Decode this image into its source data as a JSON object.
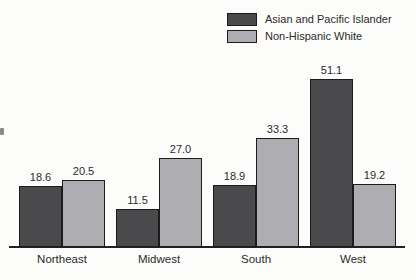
{
  "chart_data": {
    "type": "bar",
    "title": "",
    "xlabel": "",
    "ylabel": "",
    "categories": [
      "Northeast",
      "Midwest",
      "South",
      "West"
    ],
    "series": [
      {
        "name": "Asian and Pacific Islander",
        "color": "#4a4a4c",
        "values": [
          18.6,
          11.5,
          18.9,
          51.1
        ]
      },
      {
        "name": "Non-Hispanic White",
        "color": "#aeaeb2",
        "values": [
          20.5,
          27.0,
          33.3,
          19.2
        ]
      }
    ],
    "value_label_format": "one-decimal",
    "ylim": [
      0,
      55
    ],
    "grid": false,
    "legend_position": "top-right",
    "bar_outline_color": "#1c1c1c",
    "axis_color": "#222222",
    "background_color": "#fcfcfa"
  }
}
